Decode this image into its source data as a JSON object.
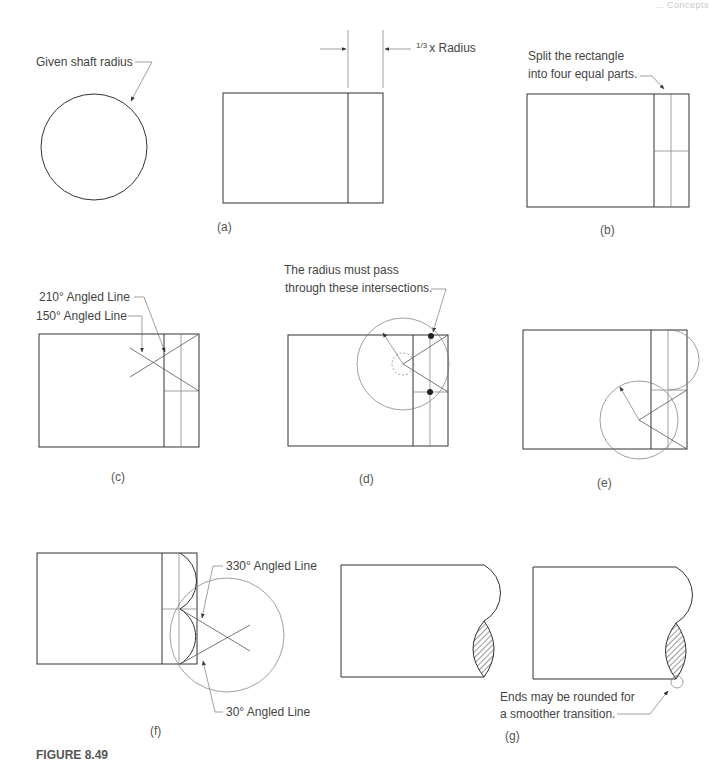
{
  "page_header": "... Concepts",
  "figure_title": "FIGURE 8.49",
  "panels": {
    "given": {
      "label": "Given shaft radius"
    },
    "a": {
      "caption": "(a)",
      "dimension_label_frac": "1/3",
      "dimension_label_text": "x Radius"
    },
    "b": {
      "caption": "(b)",
      "note_line1": "Split the rectangle",
      "note_line2": "into four equal parts."
    },
    "c": {
      "caption": "(c)",
      "label_210": "210° Angled Line",
      "label_150": "150° Angled Line"
    },
    "d": {
      "caption": "(d)",
      "note_line1": "The radius must pass",
      "note_line2": "through these intersections."
    },
    "e": {
      "caption": "(e)"
    },
    "f": {
      "caption": "(f)",
      "label_330": "330° Angled Line",
      "label_30": "30° Angled Line"
    },
    "g": {
      "caption": "(g)",
      "note_line1": "Ends may be rounded for",
      "note_line2": "a smoother transition."
    }
  },
  "colors": {
    "line": "#333333",
    "text": "#444444",
    "background": "#ffffff"
  }
}
